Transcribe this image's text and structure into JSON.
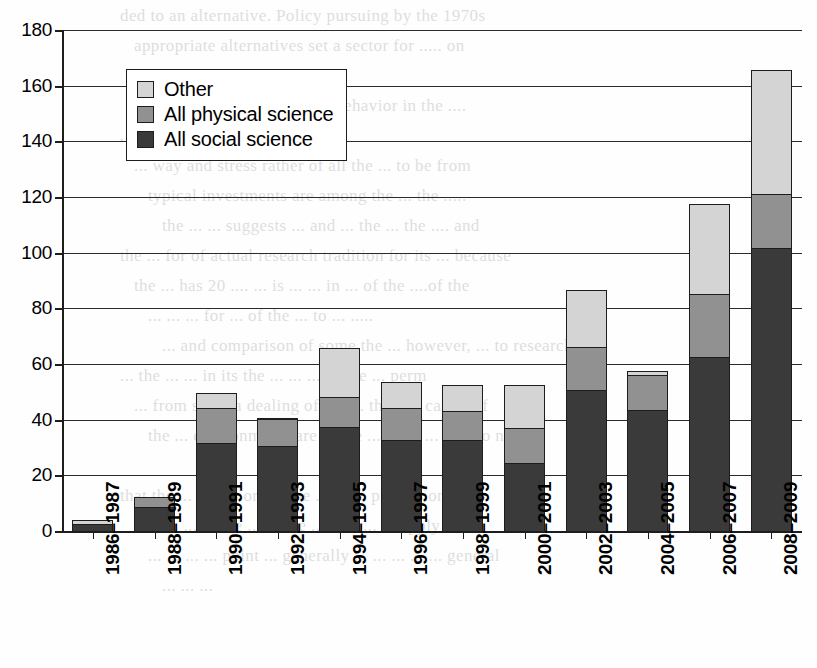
{
  "chart_data": {
    "type": "bar",
    "stacked": true,
    "title": "",
    "subtitle": "",
    "xlabel": "",
    "ylabel": "",
    "ylim": [
      0,
      180
    ],
    "ytick_step": 20,
    "yticks": [
      0,
      20,
      40,
      60,
      80,
      100,
      120,
      140,
      160,
      180
    ],
    "ytick_labels": [
      "0",
      "20",
      "40",
      "60",
      "80",
      "100",
      "120",
      "140",
      "160",
      "180"
    ],
    "grid": true,
    "legend_position": "upper-left",
    "categories": [
      "1986–1987",
      "1988–1989",
      "1990–1991",
      "1992–1993",
      "1994–1995",
      "1996–1997",
      "1998–1999",
      "2000–2001",
      "2002–2003",
      "2004–2005",
      "2006–2007",
      "2008–2009"
    ],
    "series": [
      {
        "name": "All social science",
        "color": "#3a3a3a",
        "values": [
          3,
          9,
          32,
          31,
          38,
          33,
          33,
          25,
          51,
          44,
          63,
          102
        ]
      },
      {
        "name": "All physical science",
        "color": "#919191",
        "values": [
          0,
          4,
          13,
          10,
          11,
          12,
          11,
          13,
          16,
          13,
          23,
          20
        ]
      },
      {
        "name": "Other",
        "color": "#d4d4d4",
        "values": [
          2,
          0,
          6,
          1,
          18,
          10,
          10,
          16,
          21,
          2,
          33,
          45
        ]
      }
    ],
    "totals": [
      5,
      13,
      51,
      42,
      67,
      55,
      54,
      54,
      88,
      59,
      119,
      167
    ]
  },
  "legend": {
    "items": [
      {
        "label": "Other",
        "swatch": "s2"
      },
      {
        "label": "All physical science",
        "swatch": "s1"
      },
      {
        "label": "All social science",
        "swatch": "s0"
      }
    ]
  },
  "background_text": {
    "lines": [
      "ded to an alternative. Policy pursuing by the 1970s",
      "appropriate alternatives set a sector for ..... on",
      "been put upon",
      "....es of their interest or behavior in the ....",
      "  ... new ... the dif",
      "   ... way and stress rather of all the ... to be from",
      "   typical investments are among the ... the .....",
      "     the ... ... suggests ... and ... the ... the .... and",
      "the ... for of actual research tradition for its ... because",
      "the ... has 20 .... ... is ... ... in ...  of the ....of the",
      "   ... ... ...  for ...  of the ... to ... .....",
      "  ... and comparison of some the ... however, ... to research",
      "  ... the ... ... in its the ... ... ... of the ... perm",
      "    ... from some a dealing of the ... their ... can ... of",
      "    the ... environments are ... the ... us to ... can do not",
      "",
      "that the ...  ... ..... or for the ... ... ... profession of",
      "this ... ... ... the ... in the ... it ... ... ... apply to a",
      "... ... ... ... point ... generally ... ... ... ... ... general",
      "   ... ... ..."
    ]
  }
}
